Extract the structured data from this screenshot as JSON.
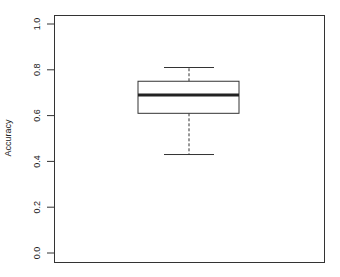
{
  "chart_data": {
    "type": "box",
    "title": "",
    "xlabel": "",
    "ylabel": "Accuracy",
    "ylim": [
      0.0,
      1.0
    ],
    "yticks": [
      "0.0",
      "0.2",
      "0.4",
      "0.6",
      "0.8",
      "1.0"
    ],
    "grid": false,
    "legend": null,
    "series": [
      {
        "name": "",
        "whisker_low": 0.43,
        "q1": 0.61,
        "median": 0.69,
        "q3": 0.75,
        "whisker_high": 0.81
      }
    ]
  }
}
